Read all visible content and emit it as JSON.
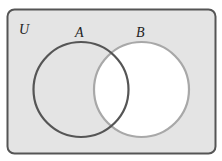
{
  "diagram": {
    "type": "venn",
    "universe_label": "U",
    "sets": [
      {
        "label": "A",
        "stroke": "#555555",
        "fill": "none"
      },
      {
        "label": "B",
        "stroke": "#a8a8a8",
        "fill": "#ffffff"
      }
    ],
    "shaded_region": "complement of B",
    "colors": {
      "universe_fill": "#e4e4e4",
      "universe_border": "#555555",
      "unshaded": "#ffffff",
      "background": "#ffffff"
    }
  }
}
